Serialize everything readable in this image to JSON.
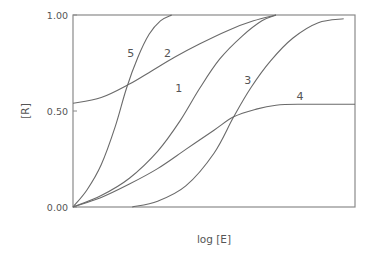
{
  "chart_data": {
    "type": "line",
    "title": "",
    "xlabel": "log [E]",
    "ylabel": "[R]",
    "xlim": [
      0,
      1
    ],
    "ylim": [
      0,
      1
    ],
    "grid": false,
    "legend": "none (curves labeled inline)",
    "x_ticks": [],
    "y_ticks": [
      {
        "value": 0.0,
        "label": "0.00"
      },
      {
        "value": 0.5,
        "label": "0.50"
      },
      {
        "value": 1.0,
        "label": "1.00"
      }
    ],
    "series": [
      {
        "name": "1",
        "label_pos": [
          0.375,
          0.62
        ],
        "points": [
          [
            0,
            0
          ],
          [
            0.1,
            0.06
          ],
          [
            0.2,
            0.15
          ],
          [
            0.3,
            0.29
          ],
          [
            0.38,
            0.45
          ],
          [
            0.45,
            0.62
          ],
          [
            0.52,
            0.77
          ],
          [
            0.6,
            0.89
          ],
          [
            0.67,
            0.97
          ],
          [
            0.72,
            1.0
          ]
        ]
      },
      {
        "name": "2",
        "label_pos": [
          0.335,
          0.8
        ],
        "points": [
          [
            0,
            0.54
          ],
          [
            0.1,
            0.57
          ],
          [
            0.2,
            0.64
          ],
          [
            0.28,
            0.71
          ],
          [
            0.36,
            0.78
          ],
          [
            0.45,
            0.85
          ],
          [
            0.55,
            0.92
          ],
          [
            0.64,
            0.97
          ],
          [
            0.72,
            1.0
          ]
        ]
      },
      {
        "name": "3",
        "label_pos": [
          0.62,
          0.66
        ],
        "points": [
          [
            0.21,
            0
          ],
          [
            0.3,
            0.03
          ],
          [
            0.4,
            0.11
          ],
          [
            0.5,
            0.28
          ],
          [
            0.57,
            0.47
          ],
          [
            0.63,
            0.62
          ],
          [
            0.7,
            0.76
          ],
          [
            0.78,
            0.88
          ],
          [
            0.87,
            0.96
          ],
          [
            0.96,
            0.98
          ]
        ]
      },
      {
        "name": "4",
        "label_pos": [
          0.805,
          0.58
        ],
        "points": [
          [
            0,
            0
          ],
          [
            0.1,
            0.05
          ],
          [
            0.2,
            0.12
          ],
          [
            0.3,
            0.2
          ],
          [
            0.4,
            0.3
          ],
          [
            0.5,
            0.4
          ],
          [
            0.57,
            0.47
          ],
          [
            0.65,
            0.51
          ],
          [
            0.72,
            0.53
          ],
          [
            0.8,
            0.535
          ],
          [
            1.0,
            0.535
          ]
        ]
      },
      {
        "name": "5",
        "label_pos": [
          0.205,
          0.8
        ],
        "points": [
          [
            0,
            0
          ],
          [
            0.05,
            0.09
          ],
          [
            0.1,
            0.22
          ],
          [
            0.15,
            0.42
          ],
          [
            0.19,
            0.62
          ],
          [
            0.23,
            0.78
          ],
          [
            0.27,
            0.9
          ],
          [
            0.31,
            0.97
          ],
          [
            0.35,
            1.0
          ]
        ]
      }
    ]
  },
  "plot_area": {
    "left": 73,
    "top": 15,
    "right": 355,
    "bottom": 207
  },
  "colors": {
    "axis": "#8a8a8a",
    "curve": "#6a6a6a",
    "text": "#555555",
    "background": "#ffffff"
  }
}
